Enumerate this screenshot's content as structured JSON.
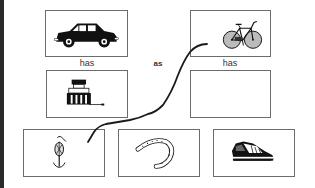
{
  "worksheet": {
    "type": "picture-analogy",
    "prompt_row": {
      "left_pair": {
        "top_item": {
          "icon": "car-icon",
          "label": "car"
        },
        "relation": "has",
        "bottom_item": {
          "icon": "engine-icon",
          "label": "engine"
        }
      },
      "connector": "as",
      "right_pair": {
        "top_item": {
          "icon": "bicycle-icon",
          "label": "bicycle"
        },
        "relation": "has",
        "bottom_item": {
          "icon": "empty-answer-box",
          "label": ""
        }
      }
    },
    "choices": [
      {
        "icon": "anchor-icon",
        "label": "anchor"
      },
      {
        "icon": "horseshoe-icon",
        "label": "horseshoe"
      },
      {
        "icon": "sneaker-icon",
        "label": "sneaker"
      }
    ],
    "drawn_answer_line": {
      "from": "bicycle-box",
      "to": "anchor-choice",
      "color": "#1a1a1a"
    }
  },
  "colors": {
    "border": "#6b6b6b",
    "ink": "#111111",
    "text": "#333333",
    "left_bar": "#2a2a2a"
  }
}
